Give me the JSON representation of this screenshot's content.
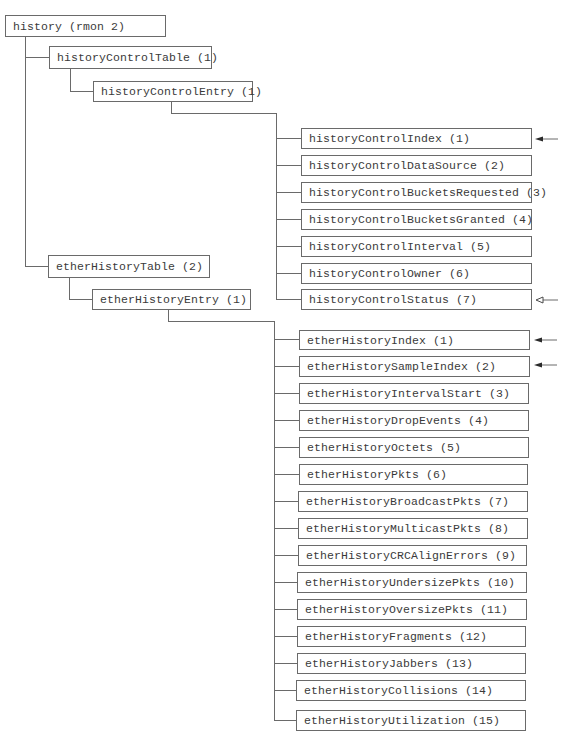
{
  "root": {
    "label": "history (rmon 2)"
  },
  "historyControlTable": {
    "label": "historyControlTable (1)"
  },
  "historyControlEntry": {
    "label": "historyControlEntry (1)"
  },
  "historyControlColumns": [
    {
      "label": "historyControlIndex (1)",
      "marker": "index-arrow-filled"
    },
    {
      "label": "historyControlDataSource (2)",
      "marker": ""
    },
    {
      "label": "historyControlBucketsRequested (3)",
      "marker": ""
    },
    {
      "label": "historyControlBucketsGranted (4)",
      "marker": ""
    },
    {
      "label": "historyControlInterval (5)",
      "marker": ""
    },
    {
      "label": "historyControlOwner (6)",
      "marker": ""
    },
    {
      "label": "historyControlStatus (7)",
      "marker": "status-arrow-hollow"
    }
  ],
  "etherHistoryTable": {
    "label": "etherHistoryTable (2)"
  },
  "etherHistoryEntry": {
    "label": "etherHistoryEntry (1)"
  },
  "etherHistoryColumns": [
    {
      "label": "etherHistoryIndex (1)",
      "marker": "index-arrow-filled"
    },
    {
      "label": "etherHistorySampleIndex (2)",
      "marker": "index-arrow-filled"
    },
    {
      "label": "etherHistoryIntervalStart (3)",
      "marker": ""
    },
    {
      "label": "etherHistoryDropEvents (4)",
      "marker": ""
    },
    {
      "label": "etherHistoryOctets (5)",
      "marker": ""
    },
    {
      "label": "etherHistoryPkts (6)",
      "marker": ""
    },
    {
      "label": "etherHistoryBroadcastPkts (7)",
      "marker": ""
    },
    {
      "label": "etherHistoryMulticastPkts (8)",
      "marker": ""
    },
    {
      "label": "etherHistoryCRCAlignErrors (9)",
      "marker": ""
    },
    {
      "label": "etherHistoryUndersizePkts (10)",
      "marker": ""
    },
    {
      "label": "etherHistoryOversizePkts (11)",
      "marker": ""
    },
    {
      "label": "etherHistoryFragments (12)",
      "marker": ""
    },
    {
      "label": "etherHistoryJabbers (13)",
      "marker": ""
    },
    {
      "label": "etherHistoryCollisions (14)",
      "marker": ""
    },
    {
      "label": "etherHistoryUtilization (15)",
      "marker": ""
    }
  ],
  "colors": {
    "line": "#6a6a6a",
    "text": "#3a3a3a",
    "background": "#ffffff"
  }
}
